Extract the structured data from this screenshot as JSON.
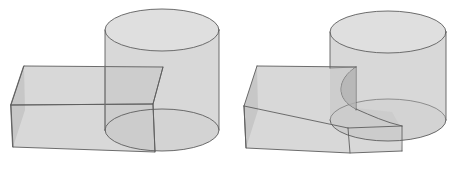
{
  "figure": {
    "background_color": "#ffffff",
    "outline_color": "#5e5e5e",
    "fill_color": "#c9c9c9",
    "fill_color_dark": "#b0b0b0",
    "fill_color_light": "#d2d2d2",
    "width": 467,
    "height": 172,
    "panel_count": 2
  },
  "panels": [
    {
      "id": "left-panel",
      "name": "operands",
      "caption": "",
      "description": "Transparent rectangular box passing through a vertical cylinder",
      "objects": [
        {
          "name": "cylinder",
          "type": "cylinder",
          "top_ellipse": {
            "cx": 162,
            "cy": 30,
            "rx": 57,
            "ry": 21
          },
          "bottom_ellipse": {
            "cx": 162,
            "cy": 130,
            "rx": 57,
            "ry": 21
          },
          "height": 100
        },
        {
          "name": "box",
          "type": "box",
          "top_face": [
            [
              24,
              66
            ],
            [
              163,
              67
            ],
            [
              153,
              104
            ],
            [
              11,
              105
            ]
          ],
          "front_face": [
            [
              11,
              105
            ],
            [
              153,
              104
            ],
            [
              155,
              152
            ],
            [
              13,
              147
            ]
          ],
          "left_face": [
            [
              24,
              66
            ],
            [
              11,
              105
            ],
            [
              13,
              147
            ]
          ]
        }
      ]
    },
    {
      "id": "right-panel",
      "name": "result",
      "caption": "",
      "description": "Result solid: box with a cylindrical notch, fused to the cylinder",
      "objects": [
        {
          "name": "cylinder",
          "type": "cylinder",
          "top_ellipse": {
            "cx": 388,
            "cy": 32,
            "rx": 58,
            "ry": 21
          },
          "bottom_ellipse": {
            "cx": 388,
            "cy": 120,
            "rx": 58,
            "ry": 21
          },
          "height": 88
        },
        {
          "name": "box",
          "type": "box",
          "top_face": [
            [
              257,
              66
            ],
            [
              356,
              67
            ],
            [
              348,
              105
            ],
            [
              244,
              106
            ]
          ],
          "front_face": [
            [
              244,
              106
            ],
            [
              348,
              105
            ],
            [
              350,
              153
            ],
            [
              246,
              148
            ]
          ],
          "left_face": [
            [
              257,
              66
            ],
            [
              244,
              106
            ],
            [
              246,
              148
            ]
          ]
        },
        {
          "name": "cut-arc",
          "type": "intersection-curve",
          "description": "Curve where the cylinder surface cuts the box top and front faces"
        }
      ]
    }
  ]
}
